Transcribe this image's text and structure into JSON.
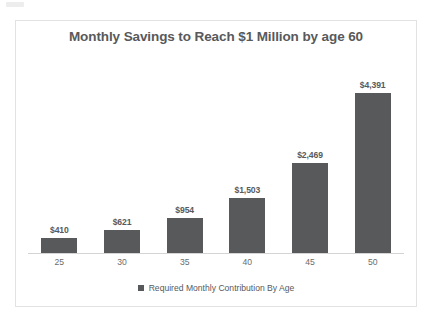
{
  "artifact": {
    "name": "scan-smudge"
  },
  "chart_data": {
    "type": "bar",
    "title": "Monthly Savings to Reach $1 Million by age 60",
    "xlabel": "",
    "ylabel": "",
    "grid": false,
    "legend_position": "bottom",
    "ylim": [
      0,
      4800
    ],
    "categories": [
      "25",
      "30",
      "35",
      "40",
      "45",
      "50"
    ],
    "values": [
      410,
      621,
      954,
      1503,
      2469,
      4391
    ],
    "data_labels": [
      "$410",
      "$621",
      "$954",
      "$1,503",
      "$2,469",
      "$4,391"
    ],
    "series": [
      {
        "name": "Required Monthly Contribution By Age",
        "color": "#58595B",
        "values": [
          410,
          621,
          954,
          1503,
          2469,
          4391
        ]
      }
    ],
    "legend": [
      "Required Monthly Contribution By Age"
    ]
  }
}
